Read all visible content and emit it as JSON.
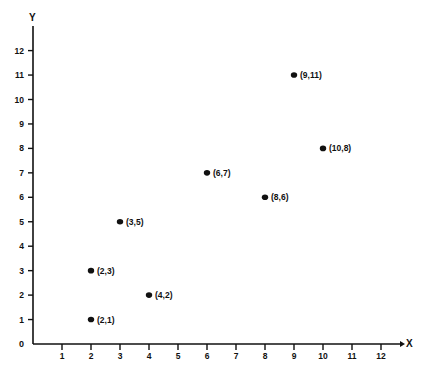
{
  "chart_data": {
    "type": "scatter",
    "title": "",
    "xlabel": "X",
    "ylabel": "Y",
    "xlim": [
      0,
      12
    ],
    "ylim": [
      0,
      12
    ],
    "grid": false,
    "legend": null,
    "x_ticks": [
      1,
      2,
      3,
      4,
      5,
      6,
      7,
      8,
      9,
      10,
      11,
      12
    ],
    "y_ticks": [
      0,
      1,
      2,
      3,
      4,
      5,
      6,
      7,
      8,
      9,
      10,
      11,
      12
    ],
    "origin_label": "0",
    "points": [
      {
        "x": 2,
        "y": 1,
        "label": "(2,1)"
      },
      {
        "x": 2,
        "y": 3,
        "label": "(2,3)"
      },
      {
        "x": 3,
        "y": 5,
        "label": "(3,5)"
      },
      {
        "x": 4,
        "y": 2,
        "label": "(4,2)"
      },
      {
        "x": 6,
        "y": 7,
        "label": "(6,7)"
      },
      {
        "x": 8,
        "y": 6,
        "label": "(8,6)"
      },
      {
        "x": 9,
        "y": 11,
        "label": "(9,11)"
      },
      {
        "x": 10,
        "y": 8,
        "label": "(10,8)"
      }
    ],
    "colors": {
      "ink": "#111111",
      "background": "#ffffff"
    }
  }
}
